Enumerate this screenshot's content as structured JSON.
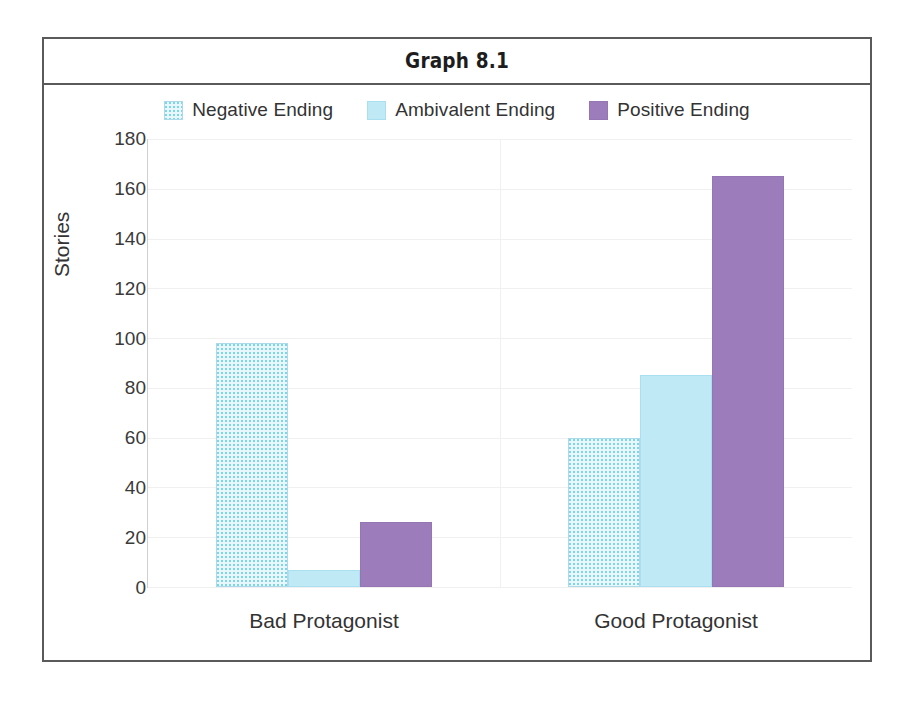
{
  "figure": {
    "title": "Graph 8.1"
  },
  "legend": {
    "position": "top",
    "items": [
      {
        "label": "Negative Ending",
        "swatch": "negative-swatch",
        "color": "#e8f7fb"
      },
      {
        "label": "Ambivalent Ending",
        "swatch": "ambivalent-swatch",
        "color": "#bfe9f4"
      },
      {
        "label": "Positive Ending",
        "swatch": "positive-swatch",
        "color": "#9d7cbb"
      }
    ]
  },
  "axes": {
    "y_title": "Stories",
    "x_title": "",
    "y_ticks": [
      "0",
      "20",
      "40",
      "60",
      "80",
      "100",
      "120",
      "140",
      "160",
      "180"
    ],
    "x_categories": [
      "Bad Protagonist",
      "Good Protagonist"
    ]
  },
  "chart_data": {
    "type": "bar",
    "title": "Graph 8.1",
    "xlabel": "",
    "ylabel": "Stories",
    "categories": [
      "Bad Protagonist",
      "Good Protagonist"
    ],
    "series": [
      {
        "name": "Negative Ending",
        "color": "#e8f7fb",
        "values": [
          98,
          60
        ]
      },
      {
        "name": "Ambivalent Ending",
        "color": "#bfe9f4",
        "values": [
          7,
          85
        ]
      },
      {
        "name": "Positive Ending",
        "color": "#9d7cbb",
        "values": [
          26,
          165
        ]
      }
    ],
    "ylim": [
      0,
      180
    ],
    "ytick_step": 20,
    "grid": true,
    "legend_position": "top",
    "bars_grouped": true
  }
}
